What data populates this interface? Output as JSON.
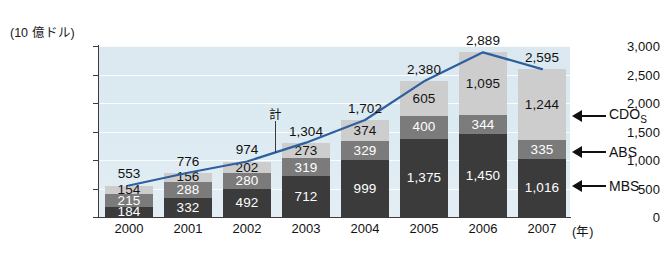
{
  "axis": {
    "unit_caption": "(10 億ドル)",
    "x_unit": "(年)",
    "y_ticks": [
      "3,000",
      "2,500",
      "2,000",
      "1,500",
      "1,000",
      "500",
      "0"
    ],
    "x_ticks": [
      "2000",
      "2001",
      "2002",
      "2003",
      "2004",
      "2005",
      "2006",
      "2007"
    ]
  },
  "annotation": {
    "total_label": "計"
  },
  "legend": [
    {
      "name": "cdos",
      "label": "CDO",
      "sub": "S"
    },
    {
      "name": "abs",
      "label": "ABS",
      "sub": ""
    },
    {
      "name": "mbs",
      "label": "MBS",
      "sub": ""
    }
  ],
  "colors": {
    "cdos": "#cdcdcd",
    "abs": "#7b7b7b",
    "mbs": "#3b3b3b",
    "line": "#2e5f9e",
    "plot_bg": "#dce9f1"
  },
  "chart_data": {
    "type": "bar",
    "stacked": true,
    "title": "",
    "xlabel": "(年)",
    "ylabel": "(10 億ドル)",
    "ylim": [
      0,
      3000
    ],
    "ytick_values": [
      0,
      500,
      1000,
      1500,
      2000,
      2500,
      3000
    ],
    "grid": true,
    "legend_position": "right",
    "categories": [
      "2000",
      "2001",
      "2002",
      "2003",
      "2004",
      "2005",
      "2006",
      "2007"
    ],
    "series": [
      {
        "name": "MBS",
        "values": [
          184,
          332,
          492,
          712,
          999,
          1375,
          1450,
          1016
        ],
        "labels": [
          "184",
          "332",
          "492",
          "712",
          "999",
          "1,375",
          "1,450",
          "1,016"
        ]
      },
      {
        "name": "ABS",
        "values": [
          215,
          288,
          280,
          319,
          329,
          400,
          344,
          335
        ],
        "labels": [
          "215",
          "288",
          "280",
          "319",
          "329",
          "400",
          "344",
          "335"
        ]
      },
      {
        "name": "CDOs",
        "values": [
          154,
          156,
          202,
          273,
          374,
          605,
          1095,
          1244
        ],
        "labels": [
          "154",
          "156",
          "202",
          "273",
          "374",
          "605",
          "1,095",
          "1,244"
        ]
      }
    ],
    "totals": {
      "name": "計",
      "values": [
        553,
        776,
        974,
        1304,
        1702,
        2380,
        2889,
        2595
      ],
      "labels": [
        "553",
        "776",
        "974",
        "1,304",
        "1,702",
        "2,380",
        "2,889",
        "2,595"
      ]
    }
  }
}
